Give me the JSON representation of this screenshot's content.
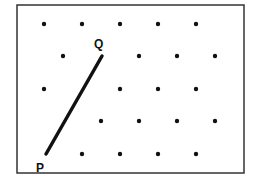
{
  "diagram": {
    "type": "dot-grid-geometry",
    "frame": {
      "x": 17,
      "y": 5,
      "width": 227,
      "height": 168,
      "stroke": "#333333"
    },
    "dot_color": "#111111",
    "dots": [
      {
        "x": 44,
        "y": 24
      },
      {
        "x": 82,
        "y": 24
      },
      {
        "x": 120,
        "y": 24
      },
      {
        "x": 158,
        "y": 24
      },
      {
        "x": 196,
        "y": 24
      },
      {
        "x": 63,
        "y": 56
      },
      {
        "x": 139,
        "y": 56
      },
      {
        "x": 177,
        "y": 56
      },
      {
        "x": 215,
        "y": 56
      },
      {
        "x": 44,
        "y": 89
      },
      {
        "x": 120,
        "y": 89
      },
      {
        "x": 158,
        "y": 89
      },
      {
        "x": 196,
        "y": 89
      },
      {
        "x": 101,
        "y": 121
      },
      {
        "x": 139,
        "y": 121
      },
      {
        "x": 177,
        "y": 121
      },
      {
        "x": 215,
        "y": 121
      },
      {
        "x": 82,
        "y": 154
      },
      {
        "x": 120,
        "y": 154
      },
      {
        "x": 158,
        "y": 154
      },
      {
        "x": 196,
        "y": 154
      }
    ],
    "segment": {
      "from": "P",
      "to": "Q",
      "x1": 46,
      "y1": 154,
      "x2": 102,
      "y2": 56,
      "stroke": "#111111"
    },
    "points": {
      "P": {
        "label": "P",
        "x": 46,
        "y": 154,
        "label_x": 36,
        "label_y": 162
      },
      "Q": {
        "label": "Q",
        "x": 102,
        "y": 56,
        "label_x": 94,
        "label_y": 38
      }
    }
  }
}
